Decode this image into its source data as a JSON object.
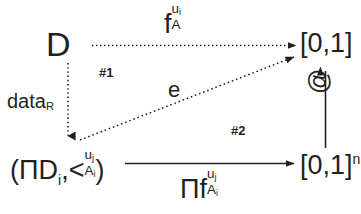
{
  "diagram": {
    "background_color": "#ffffff",
    "stroke_color": "#231f20",
    "nodes": {
      "domain": {
        "name": "D",
        "text": "D"
      },
      "unit_interval": {
        "name": "[0,1]",
        "text": "[0,1]"
      },
      "unit_interval_n": {
        "name": "[0,1]^n",
        "base": "[0,1]",
        "superscript": "n"
      },
      "product_order": {
        "name": "(ΠD_i , <_{A_i}^{u_j})",
        "open_paren": "(",
        "product_symbol": "Π",
        "d_letter": "D",
        "d_subscript": "i",
        "comma": ",",
        "relation_symbol": "<",
        "relation_superscript": "u",
        "relation_superscript_sub": "j",
        "relation_subscript": "A",
        "relation_subscript_sub": "i",
        "close_paren": ")"
      }
    },
    "edges": {
      "top": {
        "name": "f_A^{u_i}",
        "style": "dotted",
        "from": "D",
        "to": "[0,1]",
        "label": {
          "letter": "f",
          "superscript": "u",
          "superscript_sub": "i",
          "subscript": "A"
        }
      },
      "left": {
        "name": "data_R",
        "style": "dotted",
        "from": "D",
        "to": "(ΠD_i , <_{A_i}^{u_j})",
        "label": {
          "text": "data",
          "subscript": "R"
        }
      },
      "diagonal": {
        "name": "e",
        "style": "dotted",
        "from": "(ΠD_i , <_{A_i}^{u_j})",
        "to": "[0,1]",
        "label": {
          "text": "e"
        }
      },
      "bottom": {
        "name": "Πf_{A_i}^{u_j}",
        "style": "solid",
        "from": "(ΠD_i , <_{A_i}^{u_j})",
        "to": "[0,1]^n",
        "label": {
          "product_symbol": "Π",
          "letter": "f",
          "superscript": "u",
          "superscript_sub": "j",
          "subscript": "A",
          "subscript_sub": "i"
        }
      },
      "right": {
        "name": "@",
        "style": "solid",
        "from": "[0,1]^n",
        "to": "[0,1]",
        "label": {
          "text": "@"
        }
      }
    },
    "regions": {
      "region_1": "#1",
      "region_2": "#2"
    }
  }
}
